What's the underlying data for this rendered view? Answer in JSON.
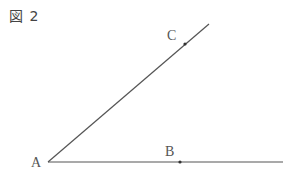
{
  "figure": {
    "title": "図 2",
    "line_color": "#555555",
    "points": {
      "A": {
        "label": "A",
        "x": 48,
        "y": 162
      },
      "B": {
        "label": "B",
        "x": 180,
        "y": 162
      },
      "C": {
        "label": "C",
        "x": 185,
        "y": 44
      }
    },
    "rays": [
      {
        "from": "A",
        "to_x": 283,
        "to_y": 162,
        "through": "B"
      },
      {
        "from": "A",
        "to_x": 209,
        "to_y": 24,
        "through": "C"
      }
    ]
  }
}
